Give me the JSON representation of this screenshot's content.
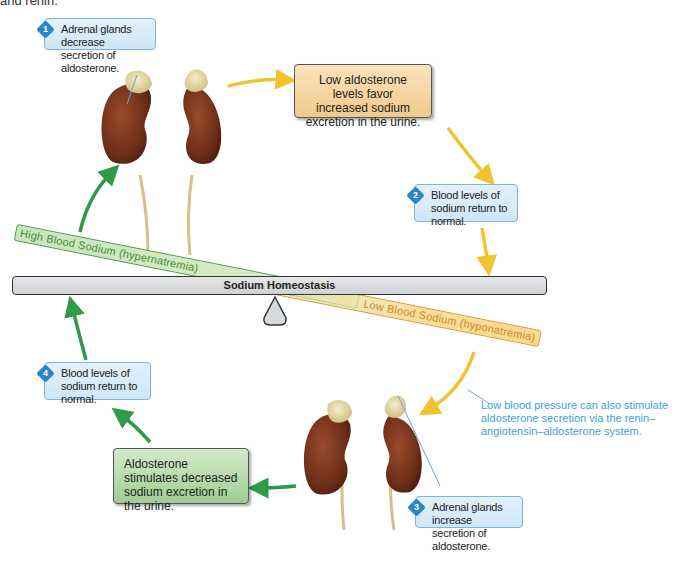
{
  "page_fragment": "and renin.",
  "title": "Sodium Homeostasis",
  "scale": {
    "label": "Sodium Homeostasis",
    "high_band": "High Blood Sodium (hypernatremia)",
    "low_band": "Low Blood Sodium (hyponatremia)"
  },
  "steps": [
    {
      "number": "1",
      "text": "Adrenal glands decrease secretion of aldosterone."
    },
    {
      "number": "2",
      "text": "Blood levels of sodium return to normal."
    },
    {
      "number": "3",
      "text": "Adrenal glands increase secretion of aldosterone."
    },
    {
      "number": "4",
      "text": "Blood levels of sodium return to normal."
    }
  ],
  "boxes": {
    "low_aldosterone": "Low aldosterone levels favor increased sodium excretion in the urine.",
    "aldosterone_stimulates": "Aldosterone stimulates decreased sodium excretion in the urine."
  },
  "note": "Low blood pressure can also stimulate aldosterone secretion via the renin–angiotensin–aldosterone system.",
  "colors": {
    "high_pathway": "#2f9a48",
    "low_pathway": "#f2c230",
    "callout_border": "#7fb6dc",
    "note_text": "#3f9fd6"
  }
}
